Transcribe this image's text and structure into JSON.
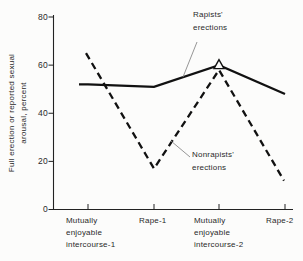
{
  "figure": {
    "ylabel_display": "Full erection or reported sexual\narousal, percent",
    "ytick_labels": [
      "80",
      "60",
      "40",
      "20",
      "0"
    ],
    "xtick_labels": [
      "Mutually\nenjoyable\nintercourse-1",
      "Rape-1",
      "Mutually\nenjoyable\nintercourse-2",
      "Rape-2"
    ],
    "annotations": {
      "rapists": "Rapists'\nerections",
      "nonrapists": "Nonrapists'\nerections"
    }
  },
  "chart_data": {
    "type": "line",
    "title": "",
    "xlabel": "",
    "ylabel": "Full erection or reported sexual arousal, percent",
    "categories": [
      "Mutually enjoyable intercourse-1",
      "Rape-1",
      "Mutually enjoyable intercourse-2",
      "Rape-2"
    ],
    "series": [
      {
        "name": "Rapists' erections",
        "line_style": "solid",
        "values": [
          52,
          51,
          60,
          48
        ],
        "marker": {
          "index": 2,
          "shape": "open-triangle"
        }
      },
      {
        "name": "Nonrapists' erections",
        "line_style": "dashed",
        "values": [
          65,
          17,
          58,
          12
        ]
      }
    ],
    "ylim": [
      0,
      80
    ],
    "yticks": [
      0,
      20,
      40,
      60,
      80
    ],
    "grid": false,
    "legend_position": "inline-annotations",
    "line_color": "#111111"
  }
}
